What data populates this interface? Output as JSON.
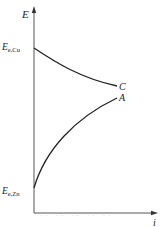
{
  "diagram": {
    "axes": {
      "y_label": "E",
      "x_label": "i"
    },
    "levels": {
      "cu_label_main": "E",
      "cu_label_sub": "e,Cu",
      "zn_label_main": "E",
      "zn_label_sub": "e,Zn"
    },
    "curves": [
      {
        "id": "C",
        "label": "C",
        "description": "Cathodic polarization curve, decreasing from E_e,Cu"
      },
      {
        "id": "A",
        "label": "A",
        "description": "Anodic polarization curve, rising from E_e,Zn"
      }
    ],
    "caption": "·· ·· ·· ·· ··",
    "colors": {
      "line": "#222222",
      "axis": "#555555",
      "background": "#ffffff"
    }
  }
}
